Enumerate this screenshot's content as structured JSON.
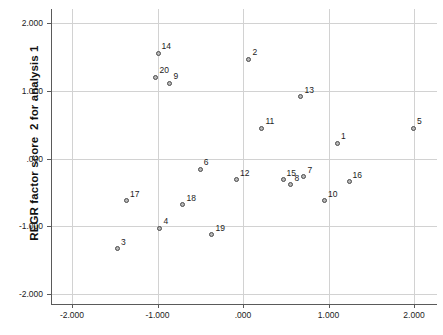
{
  "chart_data": {
    "type": "scatter",
    "title": "",
    "xlabel": "",
    "ylabel": "REGR factor score  2 for analysis 1",
    "xlim": [
      -2.4,
      2.28
    ],
    "ylim": [
      -2.21,
      2.21
    ],
    "xticks": [
      "-2.000",
      "-1.000",
      ".000",
      "1.000",
      "2.000"
    ],
    "xtick_values": [
      -2,
      -1,
      0,
      1,
      2
    ],
    "yticks": [
      "2.000",
      "1.000",
      ".000",
      "-1.000",
      "-2.000"
    ],
    "ytick_values": [
      2,
      1,
      0,
      -1,
      -2
    ],
    "grid": true,
    "legend": "none",
    "point_labels": true,
    "points": [
      {
        "label": "1",
        "x": 1.105,
        "y": 0.228
      },
      {
        "label": "2",
        "x": 0.07,
        "y": 1.463
      },
      {
        "label": "3",
        "x": -1.468,
        "y": -1.329
      },
      {
        "label": "4",
        "x": -0.971,
        "y": -1.033
      },
      {
        "label": "5",
        "x": 1.994,
        "y": 0.443
      },
      {
        "label": "6",
        "x": -0.5,
        "y": -0.162
      },
      {
        "label": "7",
        "x": 0.713,
        "y": -0.272
      },
      {
        "label": "8",
        "x": 0.561,
        "y": -0.39
      },
      {
        "label": "9",
        "x": -0.854,
        "y": 1.108
      },
      {
        "label": "10",
        "x": 0.953,
        "y": -0.62
      },
      {
        "label": "11",
        "x": 0.222,
        "y": 0.443
      },
      {
        "label": "12",
        "x": -0.076,
        "y": -0.316
      },
      {
        "label": "13",
        "x": 0.678,
        "y": 0.915
      },
      {
        "label": "14",
        "x": -0.994,
        "y": 1.551
      },
      {
        "label": "15",
        "x": 0.468,
        "y": -0.316
      },
      {
        "label": "16",
        "x": 1.24,
        "y": -0.345
      },
      {
        "label": "17",
        "x": -1.363,
        "y": -0.62
      },
      {
        "label": "18",
        "x": -0.702,
        "y": -0.679
      },
      {
        "label": "19",
        "x": -0.363,
        "y": -1.122
      },
      {
        "label": "20",
        "x": -1.018,
        "y": 1.196
      }
    ],
    "colors": {
      "marker_fill": "#b8b8b8",
      "marker_edge": "#4a4a4a",
      "grid": "#d2d2d2",
      "axis": "#5a5a5a",
      "background": "#ffffff",
      "text": "#1c1c1c"
    }
  }
}
